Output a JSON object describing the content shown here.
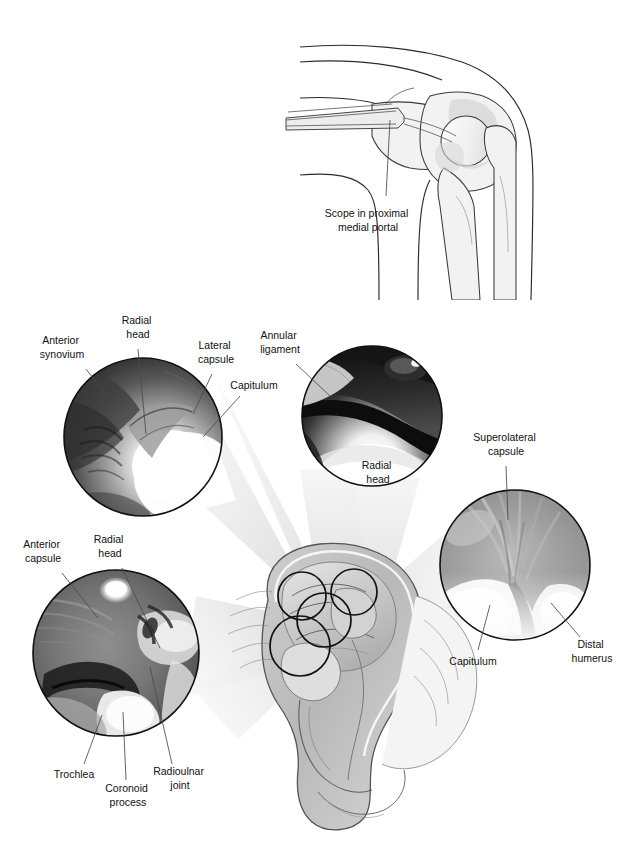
{
  "figure": {
    "background_color": "#ffffff",
    "line_color": "#111111",
    "leader_color": "#4a4a4a",
    "cone_color": "#ededed"
  },
  "inset": {
    "name": "scope-placement-inset",
    "caption_line1": "Scope in proximal",
    "caption_line2": "medial portal",
    "caption_full": "Scope in proximal medial portal"
  },
  "center": {
    "name": "elbow-joint-cutaway",
    "mini_circle_count": 4
  },
  "views": [
    {
      "id": "view-anterior-compartment",
      "position": "top-left",
      "cx": 143,
      "cy": 437,
      "r": 79,
      "inside_labels": [],
      "labels": [
        {
          "id": "anterior-synovium",
          "line1": "Anterior",
          "line2": "synovium",
          "tx": 62,
          "ty": 347,
          "lx1": 86,
          "ly1": 369,
          "lx2": 118,
          "ly2": 411
        },
        {
          "id": "radial-head-tl",
          "line1": "Radial",
          "line2": "head",
          "tx": 138,
          "ty": 327,
          "lx1": 138,
          "ly1": 349,
          "lx2": 146,
          "ly2": 434
        },
        {
          "id": "lateral-capsule",
          "line1": "Lateral",
          "line2": "capsule",
          "tx": 216,
          "ty": 352,
          "lx1": 212,
          "ly1": 374,
          "lx2": 193,
          "ly2": 414
        },
        {
          "id": "capitulum-tl",
          "line1": "Capitulum",
          "line2": "",
          "tx": 252,
          "ty": 385,
          "lx1": 240,
          "ly1": 396,
          "lx2": 203,
          "ly2": 437
        }
      ]
    },
    {
      "id": "view-radiocapitellar",
      "position": "top-center",
      "cx": 372,
      "cy": 416,
      "r": 70,
      "inside_labels": [
        {
          "id": "radial-head-tc",
          "line1": "Radial",
          "line2": "head",
          "tx": 378,
          "ty": 470
        }
      ],
      "labels": [
        {
          "id": "annular-ligament",
          "line1": "Annular",
          "line2": "ligament",
          "tx": 280,
          "ty": 342,
          "lx1": 296,
          "ly1": 364,
          "lx2": 330,
          "ly2": 396
        }
      ]
    },
    {
      "id": "view-superolateral",
      "position": "right",
      "cx": 515,
      "cy": 565,
      "r": 75,
      "inside_labels": [],
      "labels": [
        {
          "id": "superolateral-capsule",
          "line1": "Superolateral",
          "line2": "capsule",
          "tx": 506,
          "ty": 444,
          "lx1": 506,
          "ly1": 466,
          "lx2": 508,
          "ly2": 520
        },
        {
          "id": "distal-humerus",
          "line1": "Distal",
          "line2": "humerus",
          "tx": 590,
          "ty": 648,
          "lx1": 580,
          "ly1": 637,
          "lx2": 551,
          "ly2": 603
        },
        {
          "id": "capitulum-r",
          "line1": "Capitulum",
          "line2": "",
          "tx": 473,
          "ty": 661,
          "lx1": 478,
          "ly1": 650,
          "lx2": 490,
          "ly2": 605
        }
      ]
    },
    {
      "id": "view-ulnohumeral",
      "position": "bottom-left",
      "cx": 116,
      "cy": 653,
      "r": 83,
      "inside_labels": [],
      "labels": [
        {
          "id": "anterior-capsule",
          "line1": "Anterior",
          "line2": "capsule",
          "tx": 43,
          "ty": 551,
          "lx1": 62,
          "ly1": 573,
          "lx2": 98,
          "ly2": 618
        },
        {
          "id": "radial-head-bl",
          "line1": "Radial",
          "line2": "head",
          "tx": 110,
          "ty": 546,
          "lx1": 122,
          "ly1": 568,
          "lx2": 160,
          "ly2": 648
        },
        {
          "id": "trochlea",
          "line1": "Trochlea",
          "line2": "",
          "tx": 74,
          "ty": 774,
          "lx1": 84,
          "ly1": 764,
          "lx2": 102,
          "ly2": 715
        },
        {
          "id": "coronoid-process",
          "line1": "Coronoid",
          "line2": "process",
          "tx": 128,
          "ty": 791,
          "lx1": 126,
          "ly1": 780,
          "lx2": 123,
          "ly2": 712
        },
        {
          "id": "radioulnar-joint",
          "line1": "Radioulnar",
          "line2": "joint",
          "tx": 178,
          "ty": 775,
          "lx1": 172,
          "ly1": 764,
          "lx2": 150,
          "ly2": 667
        }
      ]
    }
  ]
}
